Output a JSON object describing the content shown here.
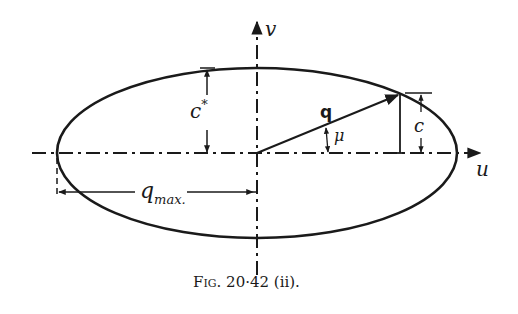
{
  "figure": {
    "caption": "Fig. 20·42 (ii).",
    "caption_prefix": "Fig.",
    "caption_number": "20·42 (ii)."
  },
  "axes": {
    "horizontal_label": "u",
    "vertical_label": "v"
  },
  "labels": {
    "vector": "q",
    "angle": "μ",
    "semi_minor": "c*",
    "semi_minor_base": "c",
    "semi_minor_sup": "*",
    "vertical_component": "c",
    "q_max_base": "q",
    "q_max_sub": "max."
  },
  "colors": {
    "ink": "#1a1a1a",
    "background": "#ffffff"
  }
}
